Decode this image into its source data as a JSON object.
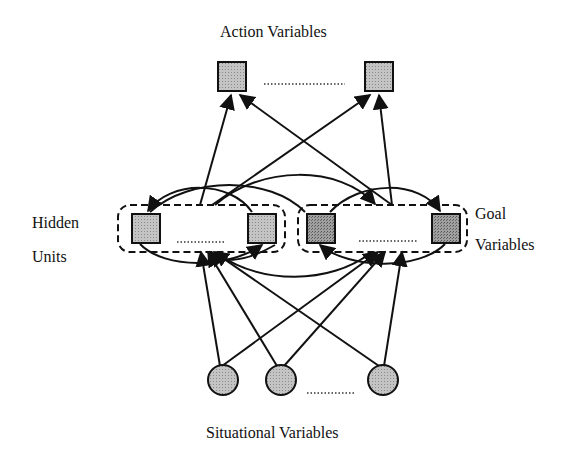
{
  "labels": {
    "action": "Action  Variables",
    "hidden_line1": "Hidden",
    "hidden_line2": "Units",
    "goal_line1": "Goal",
    "goal_line2": "Variables",
    "situational": "Situational Variables"
  },
  "layers": {
    "action": {
      "node_shape": "square",
      "nodes": 2,
      "ellipsis": true
    },
    "hidden": {
      "node_shape": "square",
      "nodes": 2,
      "ellipsis": true,
      "group": "dashed-rounded-box"
    },
    "goal": {
      "node_shape": "square",
      "nodes": 2,
      "ellipsis": true,
      "group": "dashed-rounded-box",
      "fill": "darker"
    },
    "situational": {
      "node_shape": "circle",
      "nodes": 3,
      "ellipsis": true
    }
  },
  "colors": {
    "stroke": "#111111",
    "node_fill_light": "#b8b8b8",
    "node_fill_dark": "#8f8f8f",
    "background": "#ffffff"
  }
}
